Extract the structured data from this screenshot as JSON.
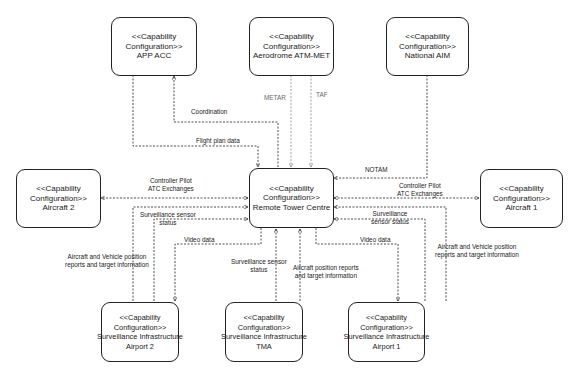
{
  "diagram": {
    "stereotype": "<<Capability",
    "stereotype_line2": "Configuration>>",
    "nodes": {
      "app_acc": {
        "name": "APP ACC"
      },
      "aerodrome_atm_met": {
        "name": "Aerodrome ATM-MET"
      },
      "national_aim": {
        "name": "National AIM"
      },
      "remote_tower_centre": {
        "name": "Remote Tower Centre"
      },
      "aircraft_2": {
        "name": "Aircraft 2"
      },
      "aircraft_1": {
        "name": "Aircraft 1"
      },
      "surv_airport_2": {
        "name": "Surveillance Infrastructure",
        "name2": "Airport 2"
      },
      "surv_tma": {
        "name": "Surveillance Infrastructure",
        "name2": "TMA"
      },
      "surv_airport_1": {
        "name": "Surveillance Infrastructure",
        "name2": "Airport 1"
      }
    },
    "edges": {
      "coordination": "Coordination",
      "flight_plan_data": "Flight plan data",
      "metar": "METAR",
      "taf": "TAF",
      "notam": "NOTAM",
      "cpdlc_left_1": "Controller Pilot",
      "cpdlc_left_2": "ATC Exchanges",
      "cpdlc_right_1": "Controller Pilot",
      "cpdlc_right_2": "ATC Exchanges",
      "surv_status_left_1": "Surveillance sensor",
      "surv_status_left_2": "status",
      "surv_status_right_1": "Surveillance",
      "surv_status_right_2": "sensor status",
      "video_left": "Video data",
      "video_right": "Video data",
      "pos_left_1": "Aircraft and Vehicle position",
      "pos_left_2": "reports and target information",
      "pos_right_1": "Aircraft and Vehicle position",
      "pos_right_2": "reports and target information",
      "surv_status_tma_1": "Surveillance sensor",
      "surv_status_tma_2": "status",
      "pos_tma_1": "Aircraft position reports",
      "pos_tma_2": "and target information"
    }
  }
}
